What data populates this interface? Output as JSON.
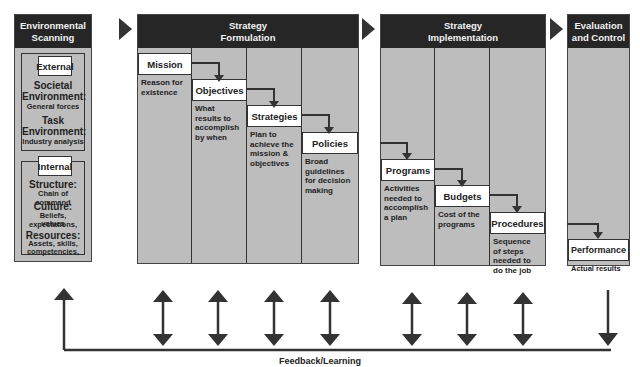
{
  "stages": {
    "scanning": {
      "title_line1": "Environmental",
      "title_line2": "Scanning",
      "external": {
        "label": "External",
        "items": [
          {
            "heading": "Societal",
            "heading2": "Environment:",
            "detail": "General forces"
          },
          {
            "heading": "Task",
            "heading2": "Environment:",
            "detail": "Industry analysis"
          }
        ]
      },
      "internal": {
        "label": "Internal",
        "items": [
          {
            "heading": "Structure:",
            "detail": "Chain of command"
          },
          {
            "heading": "Culture:",
            "detail": "Beliefs, expectations,",
            "detail2": "values"
          },
          {
            "heading": "Resources:",
            "detail": "Assets, skills,",
            "detail2": "competencies,",
            "detail3": "knowledge"
          }
        ]
      }
    },
    "formulation": {
      "title_line1": "Strategy",
      "title_line2": "Formulation",
      "steps": [
        {
          "label": "Mission",
          "desc": [
            "Reason for",
            "existence"
          ]
        },
        {
          "label": "Objectives",
          "desc": [
            "What",
            "results to",
            "accomplish",
            "by when"
          ]
        },
        {
          "label": "Strategies",
          "desc": [
            "Plan to",
            "achieve the",
            "mission &",
            "objectives"
          ]
        },
        {
          "label": "Policies",
          "desc": [
            "Broad",
            "guidelines",
            "for decision",
            "making"
          ]
        }
      ]
    },
    "implementation": {
      "title_line1": "Strategy",
      "title_line2": "Implementation",
      "steps": [
        {
          "label": "Programs",
          "desc": [
            "Activities",
            "needed to",
            "accomplish",
            "a plan"
          ]
        },
        {
          "label": "Budgets",
          "desc": [
            "Cost of the",
            "programs"
          ]
        },
        {
          "label": "Procedures",
          "desc": [
            "Sequence",
            "of steps",
            "needed to",
            "do the job"
          ]
        }
      ]
    },
    "evaluation": {
      "title_line1": "Evaluation",
      "title_line2": "and Control",
      "steps": [
        {
          "label": "Performance",
          "desc": [
            "Actual results"
          ]
        }
      ]
    }
  },
  "feedback": {
    "label": "Feedback/Learning"
  },
  "colors": {
    "header": "#262626",
    "panel": "#bdbdbd",
    "label_bg": "#ffffff",
    "arrow": "#333333"
  }
}
